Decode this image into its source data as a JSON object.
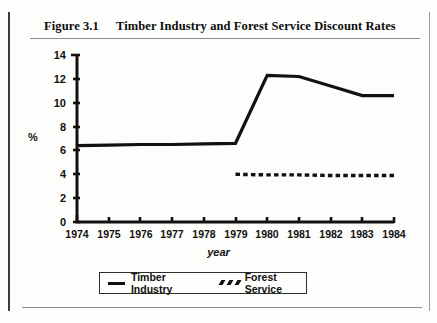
{
  "figure": {
    "number": "Figure 3.1",
    "title": "Timber Industry and Forest Service Discount Rates"
  },
  "chart_data": {
    "type": "line",
    "title": "Timber Industry and Forest Service Discount Rates",
    "xlabel": "year",
    "ylabel": "%",
    "x": [
      1974,
      1975,
      1976,
      1977,
      1978,
      1979,
      1980,
      1981,
      1982,
      1983,
      1984
    ],
    "categories": [
      "1974",
      "1975",
      "1976",
      "1977",
      "1978",
      "1979",
      "1980",
      "1981",
      "1982",
      "1983",
      "1984"
    ],
    "xlim": [
      1974,
      1984
    ],
    "ylim": [
      0,
      14
    ],
    "yticks": [
      0,
      2,
      4,
      6,
      8,
      10,
      12,
      14
    ],
    "grid": false,
    "legend_position": "bottom",
    "series": [
      {
        "name": "Timber Industry",
        "style": "solid",
        "color": "#111111",
        "x": [
          1974,
          1975,
          1976,
          1977,
          1978,
          1979,
          1980,
          1981,
          1982,
          1983,
          1984
        ],
        "values": [
          6.4,
          6.45,
          6.5,
          6.5,
          6.55,
          6.6,
          12.3,
          12.2,
          11.4,
          10.6,
          10.6
        ]
      },
      {
        "name": "Forest Service",
        "style": "dashed",
        "color": "#111111",
        "x": [
          1979,
          1980,
          1981,
          1982,
          1983,
          1984
        ],
        "values": [
          4.0,
          3.95,
          3.95,
          3.9,
          3.9,
          3.9
        ]
      }
    ]
  },
  "axes": {
    "y_tick_labels": [
      "14",
      "12",
      "10",
      "8",
      "6",
      "4",
      "2",
      "0"
    ],
    "x_tick_labels": [
      "1974",
      "1975",
      "1976",
      "1977",
      "1978",
      "1979",
      "1980",
      "1981",
      "1982",
      "1983",
      "1984"
    ],
    "y_axis_label": "%",
    "x_axis_label": "year"
  },
  "legend": {
    "items": [
      {
        "label": "Timber Industry",
        "marker": "solid-line-swatch"
      },
      {
        "label": "Forest Service",
        "marker": "dashed-line-swatch"
      }
    ]
  }
}
